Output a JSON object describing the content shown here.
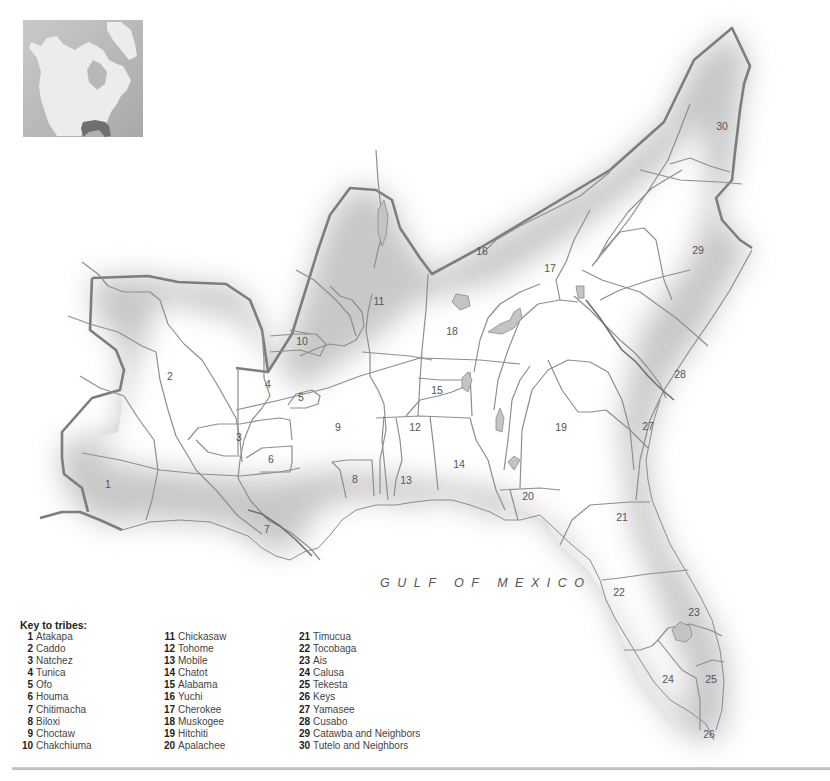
{
  "map": {
    "sea_label": "GULF OF MEXICO",
    "colors": {
      "background": "#ffffff",
      "land_shade": "#cfcfcf",
      "outer_border": "#7a7a7a",
      "inner_border": "#8c8c8c",
      "lake_fill": "#bdbdbd"
    },
    "region_labels": [
      {
        "id": "1",
        "x": 108,
        "y": 488
      },
      {
        "id": "2",
        "x": 170,
        "y": 380
      },
      {
        "id": "3",
        "x": 239,
        "y": 441
      },
      {
        "id": "4",
        "x": 268,
        "y": 388
      },
      {
        "id": "5",
        "x": 301,
        "y": 401
      },
      {
        "id": "6",
        "x": 271,
        "y": 463
      },
      {
        "id": "7",
        "x": 267,
        "y": 533
      },
      {
        "id": "8",
        "x": 355,
        "y": 483
      },
      {
        "id": "9",
        "x": 338,
        "y": 431
      },
      {
        "id": "10",
        "x": 302,
        "y": 345
      },
      {
        "id": "11",
        "x": 379,
        "y": 305
      },
      {
        "id": "12",
        "x": 415,
        "y": 431
      },
      {
        "id": "13",
        "x": 406,
        "y": 484
      },
      {
        "id": "14",
        "x": 459,
        "y": 468
      },
      {
        "id": "15",
        "x": 437,
        "y": 394
      },
      {
        "id": "16",
        "x": 482,
        "y": 255
      },
      {
        "id": "17",
        "x": 550,
        "y": 272
      },
      {
        "id": "18",
        "x": 452,
        "y": 335
      },
      {
        "id": "19",
        "x": 561,
        "y": 431
      },
      {
        "id": "20",
        "x": 528,
        "y": 500
      },
      {
        "id": "21",
        "x": 622,
        "y": 521
      },
      {
        "id": "22",
        "x": 619,
        "y": 596
      },
      {
        "id": "23",
        "x": 694,
        "y": 616
      },
      {
        "id": "24",
        "x": 668,
        "y": 683
      },
      {
        "id": "25",
        "x": 711,
        "y": 683
      },
      {
        "id": "26",
        "x": 709,
        "y": 738
      },
      {
        "id": "27",
        "x": 648,
        "y": 430
      },
      {
        "id": "28",
        "x": 680,
        "y": 378
      },
      {
        "id": "29",
        "x": 698,
        "y": 254
      },
      {
        "id": "30",
        "x": 722,
        "y": 130
      }
    ]
  },
  "inset": {
    "description": "Locator map of North America with the Southeast highlighted"
  },
  "key": {
    "title": "Key to tribes:",
    "columns": [
      [
        {
          "num": "1",
          "name": "Atakapa"
        },
        {
          "num": "2",
          "name": "Caddo"
        },
        {
          "num": "3",
          "name": "Natchez"
        },
        {
          "num": "4",
          "name": "Tunica"
        },
        {
          "num": "5",
          "name": "Ofo"
        },
        {
          "num": "6",
          "name": "Houma"
        },
        {
          "num": "7",
          "name": "Chitimacha"
        },
        {
          "num": "8",
          "name": "Biloxi"
        },
        {
          "num": "9",
          "name": "Choctaw"
        },
        {
          "num": "10",
          "name": "Chakchiuma"
        }
      ],
      [
        {
          "num": "11",
          "name": "Chickasaw"
        },
        {
          "num": "12",
          "name": "Tohome"
        },
        {
          "num": "13",
          "name": "Mobile"
        },
        {
          "num": "14",
          "name": "Chatot"
        },
        {
          "num": "15",
          "name": "Alabama"
        },
        {
          "num": "16",
          "name": "Yuchi"
        },
        {
          "num": "17",
          "name": "Cherokee"
        },
        {
          "num": "18",
          "name": "Muskogee"
        },
        {
          "num": "19",
          "name": "Hitchiti"
        },
        {
          "num": "20",
          "name": "Apalachee"
        }
      ],
      [
        {
          "num": "21",
          "name": "Timucua"
        },
        {
          "num": "22",
          "name": "Tocobaga"
        },
        {
          "num": "23",
          "name": "Ais"
        },
        {
          "num": "24",
          "name": "Calusa"
        },
        {
          "num": "25",
          "name": "Tekesta"
        },
        {
          "num": "26",
          "name": "Keys"
        },
        {
          "num": "27",
          "name": "Yamasee"
        },
        {
          "num": "28",
          "name": "Cusabo"
        },
        {
          "num": "29",
          "name": "Catawba and Neighbors"
        },
        {
          "num": "30",
          "name": "Tutelo and Neighbors"
        }
      ]
    ]
  }
}
